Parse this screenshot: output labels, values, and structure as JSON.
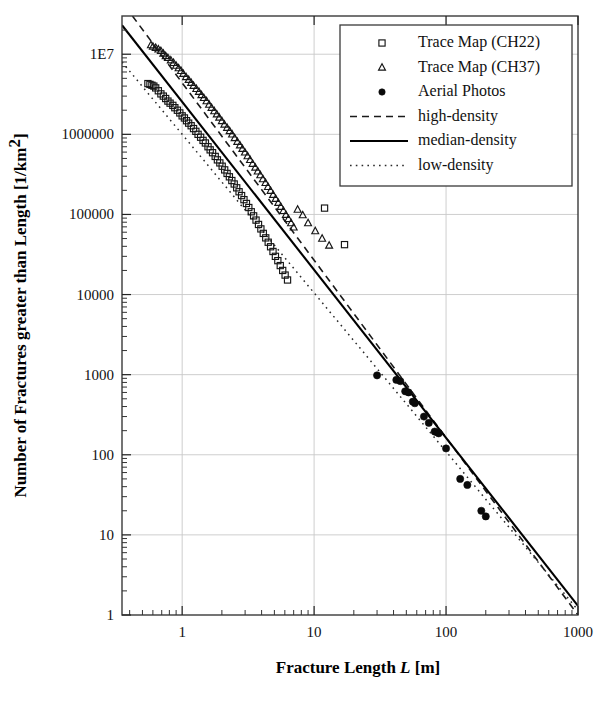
{
  "chart_data": {
    "type": "scatter",
    "title": "",
    "xlabel": "Fracture Length L [m]",
    "xlabel_plain": "Fracture Length",
    "xlabel_symbol": "L",
    "xlabel_units": "[m]",
    "ylabel": "Number of Fractures greater than Length [1/km2]",
    "ylabel_plain": "Number of Fractures greater than Length [1/km",
    "ylabel_exponent": "2",
    "ylabel_close": "]",
    "xscale": "log",
    "yscale": "log",
    "xlim": [
      0.35,
      1000
    ],
    "ylim": [
      1,
      30000000
    ],
    "grid": true,
    "grid_x_values": [
      1,
      10,
      100,
      1000
    ],
    "grid_y_values": [
      10000000,
      1000000,
      100000,
      10000,
      1000,
      100,
      10,
      1
    ],
    "xticks": [
      1,
      10,
      100,
      1000
    ],
    "xtick_labels": [
      "1",
      "10",
      "100",
      "1000"
    ],
    "yticks": [
      10000000,
      1000000,
      100000,
      10000,
      1000,
      100,
      10,
      1
    ],
    "ytick_labels": [
      "1E7",
      "1000000",
      "100000",
      "10000",
      "1000",
      "100",
      "10",
      "1"
    ],
    "legend_position": "top-right",
    "series": [
      {
        "name": "Trace Map (CH22)",
        "marker": "open-square",
        "type": "scatter",
        "points": [
          [
            0.55,
            4300000
          ],
          [
            0.57,
            4200000
          ],
          [
            0.59,
            4100000
          ],
          [
            0.61,
            4000000
          ],
          [
            0.63,
            3800000
          ],
          [
            0.66,
            3500000
          ],
          [
            0.69,
            3200000
          ],
          [
            0.72,
            3000000
          ],
          [
            0.75,
            2800000
          ],
          [
            0.78,
            2600000
          ],
          [
            0.81,
            2450000
          ],
          [
            0.85,
            2300000
          ],
          [
            0.88,
            2150000
          ],
          [
            0.92,
            2000000
          ],
          [
            0.96,
            1850000
          ],
          [
            1.0,
            1700000
          ],
          [
            1.04,
            1600000
          ],
          [
            1.08,
            1480000
          ],
          [
            1.12,
            1380000
          ],
          [
            1.17,
            1280000
          ],
          [
            1.22,
            1180000
          ],
          [
            1.27,
            1090000
          ],
          [
            1.32,
            1000000
          ],
          [
            1.38,
            920000
          ],
          [
            1.44,
            840000
          ],
          [
            1.5,
            780000
          ],
          [
            1.57,
            700000
          ],
          [
            1.63,
            640000
          ],
          [
            1.7,
            590000
          ],
          [
            1.78,
            530000
          ],
          [
            1.85,
            480000
          ],
          [
            1.93,
            440000
          ],
          [
            2.01,
            400000
          ],
          [
            2.1,
            360000
          ],
          [
            2.19,
            325000
          ],
          [
            2.28,
            295000
          ],
          [
            2.38,
            265000
          ],
          [
            2.48,
            240000
          ],
          [
            2.59,
            215000
          ],
          [
            2.7,
            192000
          ],
          [
            2.82,
            172000
          ],
          [
            2.94,
            153000
          ],
          [
            3.07,
            137000
          ],
          [
            3.2,
            122000
          ],
          [
            3.34,
            108000
          ],
          [
            3.48,
            96000
          ],
          [
            3.63,
            85000
          ],
          [
            3.79,
            75000
          ],
          [
            3.95,
            66000
          ],
          [
            4.12,
            58000
          ],
          [
            4.3,
            51000
          ],
          [
            4.49,
            45000
          ],
          [
            4.68,
            39500
          ],
          [
            4.88,
            34500
          ],
          [
            5.09,
            30000
          ],
          [
            5.31,
            26500
          ],
          [
            5.54,
            23000
          ],
          [
            5.78,
            20000
          ],
          [
            6.03,
            17500
          ],
          [
            6.29,
            15200
          ],
          [
            12.0,
            120000
          ],
          [
            17.0,
            42000
          ]
        ]
      },
      {
        "name": "Trace Map (CH37)",
        "marker": "open-triangle",
        "type": "scatter",
        "points": [
          [
            0.58,
            13000000
          ],
          [
            0.6,
            12500000
          ],
          [
            0.63,
            12000000
          ],
          [
            0.66,
            11500000
          ],
          [
            0.69,
            11000000
          ],
          [
            0.72,
            10200000
          ],
          [
            0.75,
            9500000
          ],
          [
            0.78,
            9000000
          ],
          [
            0.82,
            8400000
          ],
          [
            0.86,
            7800000
          ],
          [
            0.9,
            7200000
          ],
          [
            0.94,
            6700000
          ],
          [
            0.98,
            6200000
          ],
          [
            1.02,
            5700000
          ],
          [
            1.07,
            5200000
          ],
          [
            1.12,
            4800000
          ],
          [
            1.17,
            4400000
          ],
          [
            1.22,
            4050000
          ],
          [
            1.28,
            3700000
          ],
          [
            1.34,
            3400000
          ],
          [
            1.4,
            3100000
          ],
          [
            1.46,
            2850000
          ],
          [
            1.53,
            2600000
          ],
          [
            1.6,
            2350000
          ],
          [
            1.67,
            2150000
          ],
          [
            1.75,
            1950000
          ],
          [
            1.83,
            1780000
          ],
          [
            1.91,
            1620000
          ],
          [
            2.0,
            1470000
          ],
          [
            2.09,
            1330000
          ],
          [
            2.19,
            1210000
          ],
          [
            2.29,
            1100000
          ],
          [
            2.39,
            1000000
          ],
          [
            2.5,
            900000
          ],
          [
            2.62,
            810000
          ],
          [
            2.74,
            730000
          ],
          [
            2.86,
            660000
          ],
          [
            2.99,
            595000
          ],
          [
            3.13,
            535000
          ],
          [
            3.27,
            480000
          ],
          [
            3.42,
            430000
          ],
          [
            3.58,
            385000
          ],
          [
            3.74,
            345000
          ],
          [
            3.91,
            310000
          ],
          [
            4.09,
            276000
          ],
          [
            4.28,
            248000
          ],
          [
            4.47,
            221000
          ],
          [
            4.68,
            198000
          ],
          [
            4.89,
            176000
          ],
          [
            5.11,
            157000
          ],
          [
            5.35,
            140000
          ],
          [
            5.59,
            125000
          ],
          [
            5.85,
            111000
          ],
          [
            6.11,
            99000
          ],
          [
            6.39,
            88000
          ],
          [
            6.69,
            78000
          ],
          [
            7.0,
            69000
          ],
          [
            7.5,
            115000
          ],
          [
            8.2,
            98000
          ],
          [
            9.0,
            78000
          ],
          [
            10.2,
            62000
          ],
          [
            11.5,
            50000
          ],
          [
            13.0,
            41000
          ]
        ]
      },
      {
        "name": "Aerial Photos",
        "marker": "filled-circle",
        "type": "scatter",
        "points": [
          [
            30,
            980
          ],
          [
            42,
            860
          ],
          [
            45,
            830
          ],
          [
            49,
            620
          ],
          [
            52,
            600
          ],
          [
            56,
            460
          ],
          [
            58,
            440
          ],
          [
            68,
            300
          ],
          [
            74,
            250
          ],
          [
            82,
            195
          ],
          [
            86,
            190
          ],
          [
            88,
            185
          ],
          [
            100,
            120
          ],
          [
            128,
            50
          ],
          [
            145,
            42
          ],
          [
            185,
            20
          ],
          [
            200,
            17
          ]
        ]
      },
      {
        "name": "high-density",
        "marker": "dashed-line",
        "type": "line",
        "points": [
          [
            0.42,
            30000000
          ],
          [
            1000,
            1.0
          ]
        ]
      },
      {
        "name": "median-density",
        "marker": "solid-line",
        "type": "line",
        "points": [
          [
            0.35,
            23000000
          ],
          [
            1000,
            1.3
          ]
        ]
      },
      {
        "name": "low-density",
        "marker": "dotted-line",
        "type": "line",
        "points": [
          [
            0.35,
            8000000
          ],
          [
            1000,
            1.15
          ]
        ]
      }
    ],
    "legend_entries": [
      {
        "label": "Trace Map (CH22)",
        "marker": "open-square"
      },
      {
        "label": "Trace Map (CH37)",
        "marker": "open-triangle"
      },
      {
        "label": "Aerial Photos",
        "marker": "filled-circle"
      },
      {
        "label": "high-density",
        "marker": "dashed-line"
      },
      {
        "label": "median-density",
        "marker": "solid-line"
      },
      {
        "label": "low-density",
        "marker": "dotted-line"
      }
    ]
  },
  "colors": {
    "background": "#ffffff",
    "axis": "#3a3a3a",
    "grid": "#c8c8c8",
    "text": "#111111",
    "marker": "#151515"
  }
}
